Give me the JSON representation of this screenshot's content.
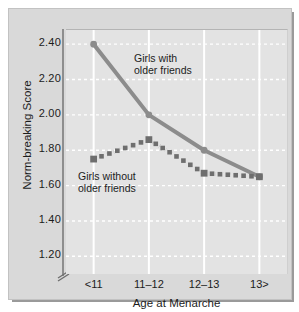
{
  "chart_data": {
    "type": "line",
    "title": "",
    "xlabel": "Age at Menarche",
    "ylabel": "Norm-breaking Score",
    "categories": [
      "<11",
      "11–12",
      "12–13",
      "13>"
    ],
    "yticks": [
      "2.40",
      "2.20",
      "2.00",
      "1.80",
      "1.60",
      "1.40",
      "1.20"
    ],
    "ytick_values": [
      2.4,
      2.2,
      2.0,
      1.8,
      1.6,
      1.4,
      1.2
    ],
    "ylim": [
      1.1,
      2.48
    ],
    "axis_break": true,
    "grid": {
      "horizontal": "dashed-white",
      "vertical": "solid-white"
    },
    "legend_position": "inline-annotations",
    "series": [
      {
        "name": "Girls with older friends",
        "values": [
          2.4,
          2.0,
          1.8,
          1.65
        ],
        "color": "#8c8c8c",
        "line_style": "solid",
        "marker": "circle",
        "line_width": 4
      },
      {
        "name": "Girls without older friends",
        "values": [
          1.75,
          1.86,
          1.67,
          1.65
        ],
        "color": "#6e6e6e",
        "line_style": "dotted",
        "marker": "square",
        "line_width": 4
      }
    ],
    "annotations": [
      {
        "text": "Girls with\nolder friends",
        "series": "Girls with older friends"
      },
      {
        "text": "Girls without\nolder friends",
        "series": "Girls without older friends"
      }
    ]
  },
  "colors": {
    "panel_background": "#d9d9d9",
    "plot_background": "#e3e3e3",
    "gridline": "#ffffff",
    "axis": "#8e8e8e",
    "text": "#1c1c1c",
    "series_with_friends": "#8c8c8c",
    "series_without_friends": "#6e6e6e"
  }
}
